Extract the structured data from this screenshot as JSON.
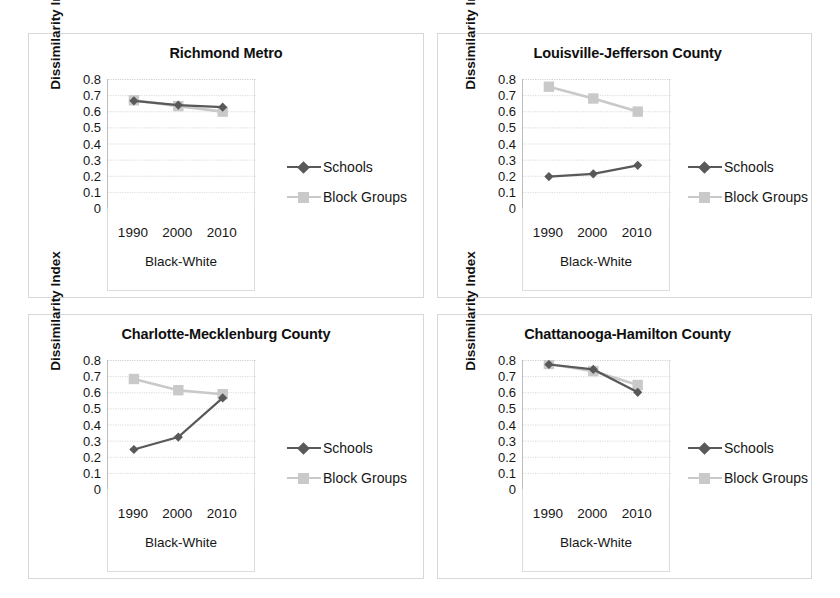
{
  "figure": {
    "series_names": [
      "Schools",
      "Block Groups"
    ],
    "colors": {
      "schools": "#595959",
      "block_groups": "#c9c9c9",
      "axis": "#bfbfbf",
      "grid": "#d9d9d9",
      "text": "#161616"
    }
  },
  "legend": {
    "schools_label": "Schools",
    "block_groups_label": "Block Groups",
    "schools_marker": "diamond-marker-icon",
    "block_groups_marker": "square-marker-icon"
  },
  "axis": {
    "ylabel": "Dissimilarity Index",
    "xlabel": "Black-White",
    "yticks": [
      "0.8",
      "0.7",
      "0.6",
      "0.5",
      "0.4",
      "0.3",
      "0.2",
      "0.1",
      "0"
    ],
    "xticks": [
      "1990",
      "2000",
      "2010"
    ],
    "ylim": [
      0,
      0.8
    ]
  },
  "panels": [
    {
      "title": "Richmond Metro"
    },
    {
      "title": "Louisville-Jefferson County"
    },
    {
      "title": "Charlotte-Mecklenburg County"
    },
    {
      "title": "Chattanooga-Hamilton County"
    }
  ],
  "chart_data": [
    {
      "type": "line",
      "title": "Richmond Metro",
      "xlabel": "Black-White",
      "ylabel": "Dissimilarity Index",
      "categories": [
        "1990",
        "2000",
        "2010"
      ],
      "ylim": [
        0,
        0.8
      ],
      "grid": true,
      "legend_position": "right",
      "series": [
        {
          "name": "Schools",
          "values": [
            0.665,
            0.638,
            0.625
          ]
        },
        {
          "name": "Block Groups",
          "values": [
            0.668,
            0.632,
            0.598
          ]
        }
      ]
    },
    {
      "type": "line",
      "title": "Louisville-Jefferson County",
      "xlabel": "Black-White",
      "ylabel": "Dissimilarity Index",
      "categories": [
        "1990",
        "2000",
        "2010"
      ],
      "ylim": [
        0,
        0.8
      ],
      "grid": true,
      "legend_position": "right",
      "series": [
        {
          "name": "Schools",
          "values": [
            0.195,
            0.212,
            0.265
          ]
        },
        {
          "name": "Block Groups",
          "values": [
            0.752,
            0.679,
            0.598
          ]
        }
      ]
    },
    {
      "type": "line",
      "title": "Charlotte-Mecklenburg County",
      "xlabel": "Black-White",
      "ylabel": "Dissimilarity Index",
      "categories": [
        "1990",
        "2000",
        "2010"
      ],
      "ylim": [
        0,
        0.8
      ],
      "grid": true,
      "legend_position": "right",
      "series": [
        {
          "name": "Schools",
          "values": [
            0.245,
            0.322,
            0.565
          ]
        },
        {
          "name": "Block Groups",
          "values": [
            0.682,
            0.613,
            0.588
          ]
        }
      ]
    },
    {
      "type": "line",
      "title": "Chattanooga-Hamilton County",
      "xlabel": "Black-White",
      "ylabel": "Dissimilarity Index",
      "categories": [
        "1990",
        "2000",
        "2010"
      ],
      "ylim": [
        0,
        0.8
      ],
      "grid": true,
      "legend_position": "right",
      "series": [
        {
          "name": "Schools",
          "values": [
            0.772,
            0.742,
            0.6
          ]
        },
        {
          "name": "Block Groups",
          "values": [
            0.775,
            0.731,
            0.645
          ]
        }
      ]
    }
  ]
}
